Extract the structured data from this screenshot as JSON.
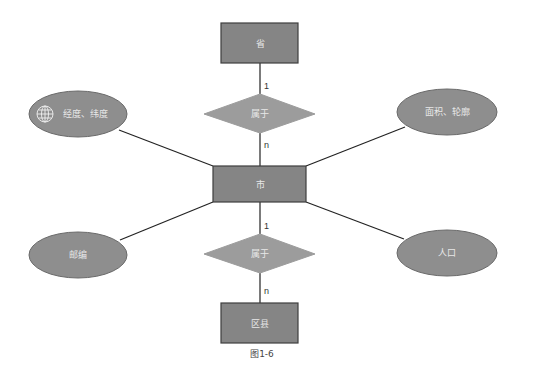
{
  "diagram": {
    "type": "ER diagram",
    "caption": "图1-6",
    "colors": {
      "entity_fill": "#858585",
      "entity_stroke": "#3e3e3e",
      "relationship_fill": "#9c9c9c",
      "attribute_fill": "#8e8e8e",
      "attribute_stroke": "#6a6a6a",
      "line": "#222222",
      "label_text": "#e8e8e8"
    },
    "entities": [
      {
        "id": "province",
        "label": "省"
      },
      {
        "id": "city",
        "label": "市"
      },
      {
        "id": "district",
        "label": "区县"
      }
    ],
    "relationships": [
      {
        "id": "rel_top",
        "label": "属于",
        "from": "province",
        "to": "city",
        "card_from": "1",
        "card_to": "n"
      },
      {
        "id": "rel_bottom",
        "label": "属于",
        "from": "city",
        "to": "district",
        "card_from": "1",
        "card_to": "n"
      }
    ],
    "attributes": [
      {
        "id": "lnglat",
        "label": "经度、纬度",
        "icon": "globe-icon",
        "entity": "city"
      },
      {
        "id": "area",
        "label": "面积、轮廓",
        "entity": "city"
      },
      {
        "id": "postcode",
        "label": "邮编",
        "entity": "city"
      },
      {
        "id": "population",
        "label": "人口",
        "entity": "city"
      }
    ]
  }
}
